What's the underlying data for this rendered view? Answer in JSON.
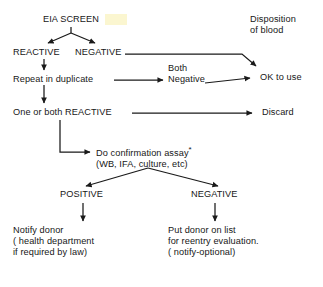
{
  "diagram": {
    "background_color": "#ffffff",
    "text_color": "#171717",
    "line_color": "#1a1a1a",
    "highlight_color": "#fbf6ce"
  },
  "nodes": {
    "eia_screen": "EIA SCREEN",
    "disposition": "Disposition\nof blood",
    "reactive": "REACTIVE",
    "negative_top": "NEGATIVE",
    "repeat_in_duplicate": "Repeat in duplicate",
    "both_negative": "Both\nNegative",
    "ok_to_use": "OK to use",
    "one_or_both_reactive": "One or both REACTIVE",
    "discard": "Discard",
    "confirmation_assay_line1": "Do confirmation assay",
    "confirmation_assay_star": "*",
    "confirmation_assay_line2": "(WB, IFA, culture, etc)",
    "positive": "POSITIVE",
    "negative_bottom": "NEGATIVE",
    "notify_donor": "Notify donor\n( health department\nif required by law)",
    "put_donor_on_list": "Put donor on list\nfor reentry evaluation.\n( notify-optional)"
  },
  "edges": [
    {
      "name": "eia-to-reactive",
      "label": ""
    },
    {
      "name": "eia-to-negative",
      "label": ""
    },
    {
      "name": "reactive-to-repeat",
      "label": ""
    },
    {
      "name": "negative-to-ok-to-use",
      "label": ""
    },
    {
      "name": "repeat-to-both-negative",
      "label": ""
    },
    {
      "name": "both-negative-to-ok-to-use",
      "label": ""
    },
    {
      "name": "repeat-to-one-or-both-reactive",
      "label": ""
    },
    {
      "name": "one-or-both-reactive-to-discard",
      "label": ""
    },
    {
      "name": "one-or-both-reactive-to-confirmation-assay",
      "label": ""
    },
    {
      "name": "confirmation-to-positive",
      "label": ""
    },
    {
      "name": "confirmation-to-negative",
      "label": ""
    },
    {
      "name": "positive-to-notify-donor",
      "label": ""
    },
    {
      "name": "negative-to-put-donor-on-list",
      "label": ""
    }
  ]
}
